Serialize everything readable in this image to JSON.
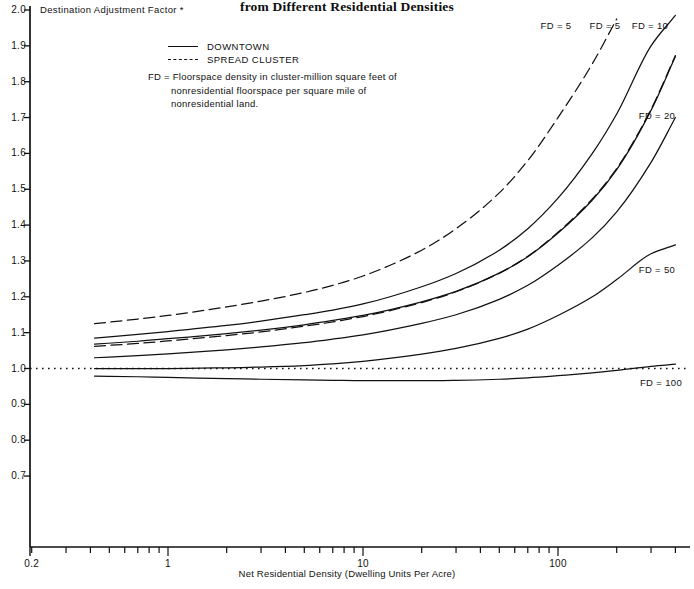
{
  "title": "from Different Residential Densities",
  "axis": {
    "y_label": "Destination Adjustment Factor *",
    "x_label": "Net Residential Density (Dwelling Units Per Acre)",
    "y_ticks": [
      "2.0",
      "1.9",
      "1.8",
      "1.7",
      "1.6",
      "1.5",
      "1.4",
      "1.3",
      "1.2",
      "1.1",
      "1.0",
      "0.9",
      "0.8",
      "0.7"
    ],
    "x_ticks": [
      "0.2",
      "1",
      "10",
      "100"
    ]
  },
  "legend": {
    "downtown": "DOWNTOWN",
    "spread_cluster": "SPREAD CLUSTER",
    "note_prefix": "FD =",
    "note_body": "Floorspace density in cluster-million square feet of nonresidential floorspace per square mile of nonresidential land."
  },
  "curve_labels": [
    {
      "text": "FD = 5",
      "x": 556,
      "y": 20
    },
    {
      "text": "FD = 5",
      "x": 605,
      "y": 20
    },
    {
      "text": "FD = 10",
      "x": 650,
      "y": 20
    },
    {
      "text": "FD = 20",
      "x": 657,
      "y": 110
    },
    {
      "text": "FD = 50",
      "x": 657,
      "y": 264
    },
    {
      "text": "FD = 100",
      "x": 661,
      "y": 377
    }
  ],
  "chart_data": {
    "type": "line",
    "title": "from Different Residential Densities",
    "xlabel": "Net Residential Density (Dwelling Units Per Acre)",
    "ylabel": "Destination Adjustment Factor *",
    "xscale": "log",
    "xlim": [
      0.2,
      400
    ],
    "ylim": [
      0.655,
      2.0
    ],
    "grid": false,
    "legend": [
      "DOWNTOWN",
      "SPREAD CLUSTER"
    ],
    "reference_line": {
      "y": 1.0,
      "style": "dotted"
    },
    "x": [
      0.42,
      0.7,
      1,
      2,
      3,
      5,
      7,
      10,
      20,
      30,
      50,
      70,
      100,
      150,
      200,
      300,
      400
    ],
    "series": [
      {
        "name": "FD = 5 (SPREAD CLUSTER)",
        "style": "dashed",
        "label": "FD = 5",
        "values": [
          1.125,
          1.138,
          1.148,
          1.172,
          1.188,
          1.212,
          1.232,
          1.258,
          1.33,
          1.39,
          1.49,
          1.58,
          1.7,
          1.85,
          1.975,
          null,
          null
        ]
      },
      {
        "name": "FD = 5 (DOWNTOWN)",
        "style": "solid",
        "label": "FD = 5",
        "values": [
          1.085,
          1.095,
          1.103,
          1.12,
          1.132,
          1.15,
          1.163,
          1.18,
          1.228,
          1.265,
          1.33,
          1.39,
          1.475,
          1.6,
          1.71,
          1.9,
          1.985
        ]
      },
      {
        "name": "FD = 10 (DOWNTOWN)",
        "style": "solid",
        "label": "FD = 10",
        "values": [
          1.068,
          1.076,
          1.083,
          1.097,
          1.107,
          1.122,
          1.134,
          1.148,
          1.186,
          1.215,
          1.266,
          1.312,
          1.378,
          1.47,
          1.555,
          1.72,
          1.87
        ]
      },
      {
        "name": "FD = 10 (SPREAD CLUSTER)",
        "style": "dashed",
        "label": "FD = 10",
        "values": [
          1.062,
          1.07,
          1.077,
          1.092,
          1.102,
          1.118,
          1.13,
          1.145,
          1.184,
          1.214,
          1.266,
          1.313,
          1.38,
          1.473,
          1.558,
          1.723,
          1.873
        ]
      },
      {
        "name": "FD = 20",
        "style": "solid",
        "label": "FD = 20",
        "values": [
          1.03,
          1.036,
          1.041,
          1.052,
          1.06,
          1.072,
          1.082,
          1.094,
          1.126,
          1.15,
          1.193,
          1.232,
          1.288,
          1.365,
          1.437,
          1.575,
          1.7
        ]
      },
      {
        "name": "FD = 50",
        "style": "solid",
        "label": "FD = 50",
        "values": [
          1.0,
          1.0,
          1.0,
          1.002,
          1.004,
          1.008,
          1.013,
          1.02,
          1.04,
          1.056,
          1.084,
          1.11,
          1.148,
          1.2,
          1.248,
          1.32,
          1.345
        ]
      },
      {
        "name": "FD = 100",
        "style": "solid",
        "label": "FD = 100",
        "values": [
          0.979,
          0.977,
          0.975,
          0.972,
          0.97,
          0.968,
          0.967,
          0.966,
          0.966,
          0.967,
          0.97,
          0.974,
          0.98,
          0.988,
          0.995,
          1.006,
          1.012
        ]
      }
    ]
  }
}
